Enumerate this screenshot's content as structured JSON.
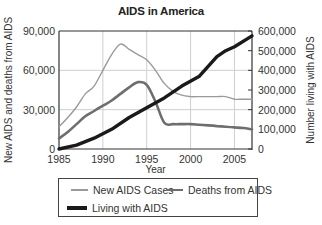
{
  "chart_data": {
    "type": "line",
    "title": "AIDS in America",
    "xlabel": "Year",
    "ylabel_left": "New AIDS and deaths from AIDS",
    "ylabel_right": "Number living with AIDS",
    "xlim": [
      1985,
      2007
    ],
    "ylim_left": [
      0,
      90000
    ],
    "ylim_right": [
      0,
      600000
    ],
    "x_ticks": [
      "1985",
      "1990",
      "1995",
      "2000",
      "2005"
    ],
    "y_ticks_left": [
      "0",
      "30,000",
      "60,000",
      "90,000"
    ],
    "y_ticks_right": [
      "0",
      "100,000",
      "200,000",
      "300,000",
      "400,000",
      "500,000",
      "600,000"
    ],
    "grid": true,
    "legend_position": "bottom",
    "series": [
      {
        "name": "New AIDS Cases",
        "axis": "left",
        "color": "#9a9a9a",
        "x": [
          1985,
          1986,
          1987,
          1988,
          1989,
          1990,
          1991,
          1992,
          1993,
          1994,
          1995,
          1996,
          1997,
          1998,
          1999,
          2000,
          2001,
          2002,
          2003,
          2004,
          2005,
          2006,
          2007
        ],
        "values": [
          17000,
          24000,
          32000,
          42000,
          48000,
          60000,
          72000,
          80000,
          76000,
          72000,
          68000,
          60000,
          50000,
          44000,
          41000,
          40000,
          40000,
          40000,
          40000,
          40000,
          38000,
          38000,
          38000
        ]
      },
      {
        "name": "Deaths from AIDS",
        "axis": "left",
        "color": "#6e6e6e",
        "x": [
          1985,
          1986,
          1987,
          1988,
          1989,
          1990,
          1991,
          1992,
          1993,
          1994,
          1995,
          1996,
          1997,
          1998,
          1999,
          2000,
          2001,
          2002,
          2003,
          2004,
          2005,
          2006,
          2007
        ],
        "values": [
          8000,
          13000,
          19000,
          25000,
          29000,
          33000,
          37000,
          42000,
          47000,
          51000,
          49000,
          36000,
          20000,
          19000,
          19000,
          19000,
          18500,
          18000,
          17500,
          17000,
          16500,
          16000,
          15000
        ]
      },
      {
        "name": "Living with AIDS",
        "axis": "right",
        "color": "#1a1a1a",
        "x": [
          1985,
          1987,
          1989,
          1991,
          1993,
          1995,
          1997,
          1999,
          2001,
          2003,
          2004,
          2005,
          2007
        ],
        "values": [
          0,
          20000,
          55000,
          100000,
          160000,
          210000,
          260000,
          320000,
          370000,
          470000,
          500000,
          520000,
          575000
        ]
      }
    ]
  },
  "legend": {
    "items": [
      {
        "label": "New AIDS Cases"
      },
      {
        "label": "Deaths from AIDS"
      },
      {
        "label": "Living with AIDS"
      }
    ]
  }
}
